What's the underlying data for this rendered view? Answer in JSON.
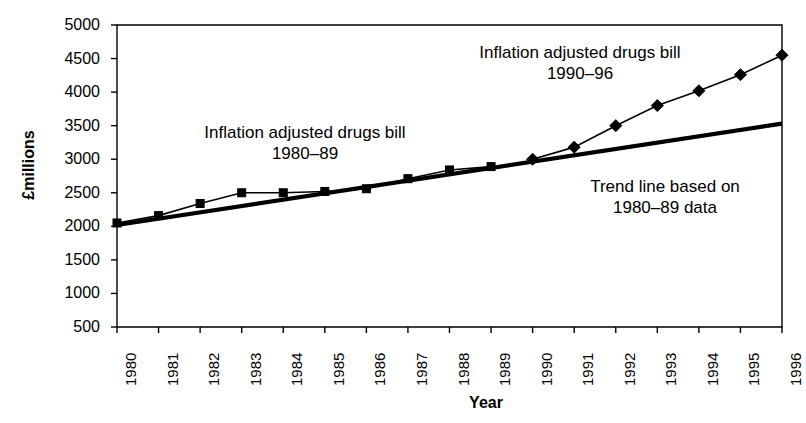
{
  "chart_data": {
    "type": "line",
    "title": "",
    "xlabel": "Year",
    "ylabel": "£millions",
    "xlim": [
      1980,
      1996
    ],
    "ylim": [
      500,
      5000
    ],
    "ytick_labels": [
      "5000",
      "4500",
      "4000",
      "3500",
      "3000",
      "2500",
      "2000",
      "1500",
      "1000",
      "500"
    ],
    "ytick_values": [
      5000,
      4500,
      4000,
      3500,
      3000,
      2500,
      2000,
      1500,
      1000,
      500
    ],
    "xtick_labels": [
      "1980",
      "1981",
      "1982",
      "1983",
      "1984",
      "1985",
      "1986",
      "1987",
      "1988",
      "1989",
      "1990",
      "1991",
      "1992",
      "1993",
      "1994",
      "1995",
      "1996"
    ],
    "x": [
      1980,
      1981,
      1982,
      1983,
      1984,
      1985,
      1986,
      1987,
      1988,
      1989,
      1990,
      1991,
      1992,
      1993,
      1994,
      1995,
      1996
    ],
    "grid": false,
    "legend_position": "none",
    "series": [
      {
        "name": "Inflation adjusted drugs bill 1980–89",
        "marker": "square",
        "x": [
          1980,
          1981,
          1982,
          1983,
          1984,
          1985,
          1986,
          1987,
          1988,
          1989
        ],
        "values": [
          2050,
          2160,
          2340,
          2500,
          2500,
          2520,
          2560,
          2710,
          2840,
          2890
        ]
      },
      {
        "name": "Inflation adjusted drugs bill 1990–96",
        "marker": "diamond",
        "x": [
          1990,
          1991,
          1992,
          1993,
          1994,
          1995,
          1996
        ],
        "values": [
          3000,
          3180,
          3500,
          3800,
          4020,
          4260,
          4550
        ]
      },
      {
        "name": "Trend line based on 1980–89 data",
        "marker": "none",
        "x": [
          1980,
          1996
        ],
        "values": [
          2020,
          3530
        ]
      }
    ],
    "annotations": [
      {
        "id": "annot-a",
        "text": "Inflation adjusted drugs bill\n1980–89"
      },
      {
        "id": "annot-b",
        "text": "Inflation adjusted drugs bill\n1990–96"
      },
      {
        "id": "annot-c",
        "text": "Trend line based on\n1980–89 data"
      }
    ],
    "colors": {
      "line": "#000000",
      "marker": "#000000",
      "trend": "#000000",
      "axis": "#000000",
      "background": "#ffffff"
    }
  }
}
